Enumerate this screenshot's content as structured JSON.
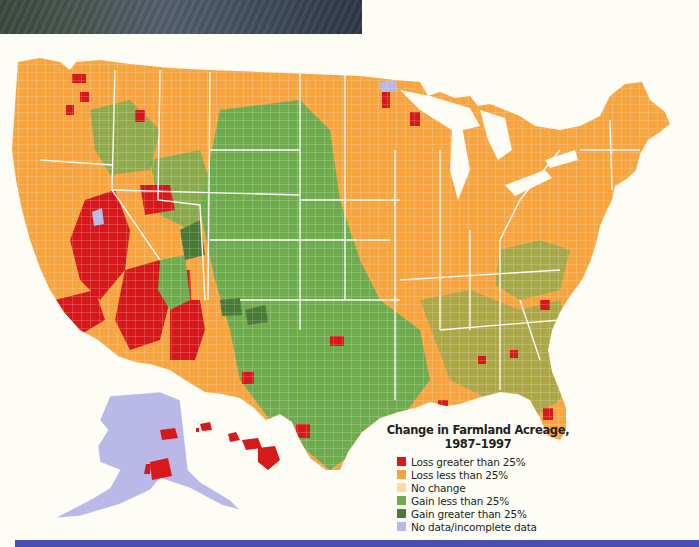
{
  "header_photo": {
    "description": "forest photograph strip"
  },
  "map": {
    "title": "Change in Farmland Acreage,",
    "subtitle": "1987–1997",
    "colors": {
      "loss_gt_25": "#d7191c",
      "loss_lt_25": "#f8a540",
      "no_change": "#fbd9a0",
      "gain_lt_25": "#6fac4f",
      "gain_gt_25": "#4b7a37",
      "no_data": "#b9b8e6",
      "boundary": "#ffffff"
    },
    "legend": {
      "items": [
        {
          "label": "Loss greater than 25%",
          "color": "#d7191c"
        },
        {
          "label": "Loss less than 25%",
          "color": "#f8a540"
        },
        {
          "label": "No change",
          "color": "#fbd9a0"
        },
        {
          "label": "Gain less than 25%",
          "color": "#6fac4f"
        },
        {
          "label": "Gain greater than 25%",
          "color": "#4b7a37"
        },
        {
          "label": "No data/incomplete data",
          "color": "#b9b8e6"
        }
      ]
    },
    "regions": {
      "alaska": "No data/incomplete data",
      "hawaii": "Loss greater than 25%"
    }
  },
  "footer_band": {
    "color": "#4a4db0"
  }
}
